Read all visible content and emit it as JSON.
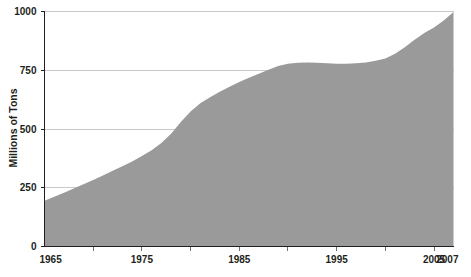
{
  "chart_data": {
    "type": "area",
    "title": "",
    "xlabel": "",
    "ylabel": "Millions of Tons",
    "xlim": [
      1965,
      2007
    ],
    "ylim": [
      0,
      1000
    ],
    "grid": true,
    "legend": null,
    "series_color": "#9a9a9a",
    "y_ticks": [
      0,
      250,
      500,
      750,
      1000
    ],
    "y_tick_labels": [
      "0",
      "250",
      "500",
      "750",
      "1000"
    ],
    "x_ticks": [
      1965,
      1975,
      1985,
      1995,
      2005,
      2007
    ],
    "x_tick_labels": [
      "1965",
      "1975",
      "1985",
      "1995",
      "2005",
      "2007"
    ],
    "x_minor_ticks": [
      1970,
      1975,
      1980,
      1985,
      1990,
      1995,
      2000,
      2005
    ],
    "x": [
      1965,
      1966,
      1967,
      1968,
      1969,
      1970,
      1971,
      1972,
      1973,
      1974,
      1975,
      1976,
      1977,
      1978,
      1979,
      1980,
      1981,
      1982,
      1983,
      1984,
      1985,
      1986,
      1987,
      1988,
      1989,
      1990,
      1991,
      1992,
      1993,
      1994,
      1995,
      1996,
      1997,
      1998,
      1999,
      2000,
      2001,
      2002,
      2003,
      2004,
      2005,
      2006,
      2007
    ],
    "values": [
      195,
      212,
      229,
      247,
      265,
      283,
      302,
      322,
      342,
      362,
      385,
      410,
      440,
      480,
      530,
      575,
      610,
      635,
      658,
      680,
      700,
      718,
      735,
      752,
      768,
      778,
      782,
      783,
      782,
      780,
      778,
      778,
      780,
      783,
      790,
      800,
      820,
      848,
      880,
      908,
      932,
      962,
      998
    ],
    "values_label": "Millions of Tons"
  },
  "axis": {
    "y_title": "Millions of Tons"
  }
}
